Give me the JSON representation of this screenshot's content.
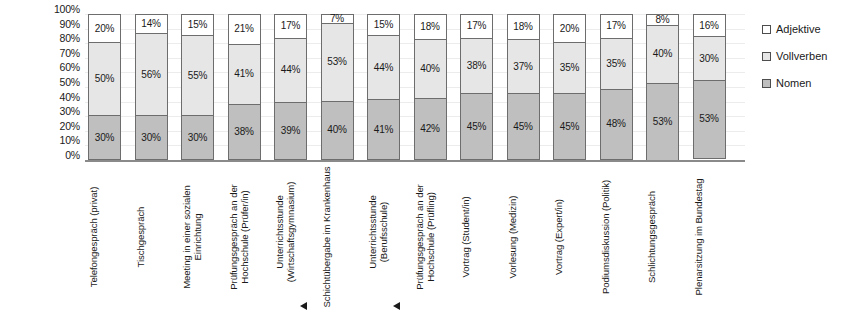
{
  "chart_data": {
    "type": "bar",
    "subtype": "stacked-100-percent",
    "title": "",
    "xlabel": "",
    "ylabel": "",
    "ylim": [
      0,
      100
    ],
    "ytick_labels": [
      "100%",
      "90%",
      "80%",
      "70%",
      "60%",
      "50%",
      "40%",
      "30%",
      "20%",
      "10%",
      "0%"
    ],
    "ytick_values": [
      100,
      90,
      80,
      70,
      60,
      50,
      40,
      30,
      20,
      10,
      0
    ],
    "grid": true,
    "legend_position": "right",
    "value_suffix": "%",
    "categories": [
      "Telefongespräch (privat)",
      "Tischgespräch",
      "Meeting in einer sozialen Einrichtung",
      "Prüfungsgespräch an der Hochschule (Prüfer/in)",
      "Unterrichtsstunde (Wirtschaftsgymnasium)",
      "Schichtübergabe im Krankenhaus",
      "Unterrichtsstunde (Berufsschule)",
      "Prüfungsgespräch an der Hochschule (Prüfling)",
      "Vortrag (Student/in)",
      "Vorlesung (Medizin)",
      "Vortrag (Expert/in)",
      "Podiumsdiskussion (Politik)",
      "Schlichtungsgespräch",
      "Plenarsitzung im Bundestag"
    ],
    "category_markers": [
      false,
      false,
      false,
      false,
      true,
      false,
      true,
      false,
      false,
      false,
      false,
      false,
      false,
      false
    ],
    "series": [
      {
        "name": "Adjektive",
        "color": "#ffffff",
        "values": [
          20,
          14,
          15,
          21,
          17,
          7,
          15,
          18,
          17,
          18,
          20,
          17,
          8,
          16
        ]
      },
      {
        "name": "Vollverben",
        "color": "#e6e6e6",
        "values": [
          50,
          56,
          55,
          41,
          44,
          53,
          44,
          40,
          38,
          37,
          35,
          35,
          40,
          30
        ]
      },
      {
        "name": "Nomen",
        "color": "#bfbfbf",
        "values": [
          30,
          30,
          30,
          38,
          39,
          40,
          41,
          42,
          45,
          45,
          45,
          48,
          53,
          53
        ]
      }
    ]
  },
  "legend": {
    "items": [
      {
        "label": "Adjektive",
        "color": "#ffffff"
      },
      {
        "label": "Vollverben",
        "color": "#e6e6e6"
      },
      {
        "label": "Nomen",
        "color": "#bfbfbf"
      }
    ]
  }
}
